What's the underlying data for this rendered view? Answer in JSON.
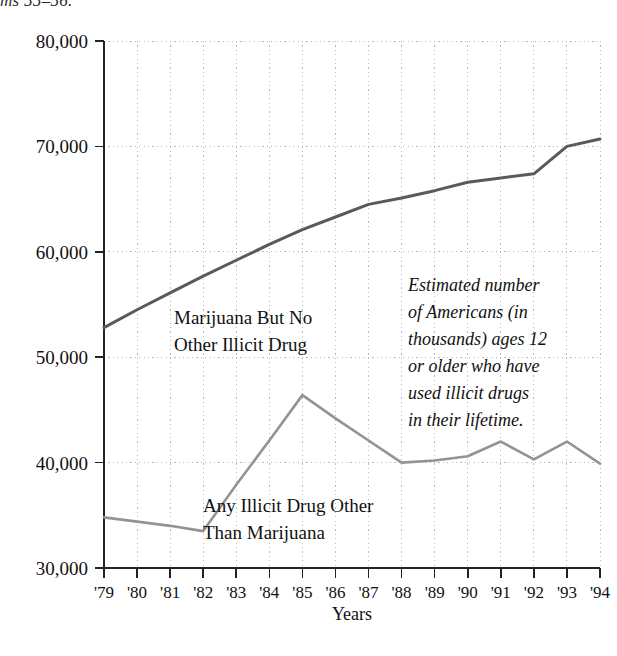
{
  "page": {
    "header_fragment": "ms 55–56."
  },
  "chart_data": {
    "type": "line",
    "title": "",
    "subtitle": "",
    "xlabel": "Years",
    "ylabel": "",
    "grid": true,
    "legend_position": "inline-annotation",
    "categories": [
      "'79",
      "'80",
      "'81",
      "'82",
      "'83",
      "'84",
      "'85",
      "'86",
      "'87",
      "'88",
      "'89",
      "'90",
      "'91",
      "'92",
      "'93",
      "'94"
    ],
    "x": [
      1979,
      1980,
      1981,
      1982,
      1983,
      1984,
      1985,
      1986,
      1987,
      1988,
      1989,
      1990,
      1991,
      1992,
      1993,
      1994
    ],
    "xlim": [
      1979,
      1994
    ],
    "ylim": [
      30000,
      80000
    ],
    "ytick_values": [
      30000,
      40000,
      50000,
      60000,
      70000,
      80000
    ],
    "ytick_labels": [
      "30,000",
      "40,000",
      "50,000",
      "60,000",
      "70,000",
      "80,000"
    ],
    "series": [
      {
        "name": "Marijuana But No Other Illicit Drug",
        "color": "#5a5a5a",
        "values": [
          52800,
          54500,
          56100,
          57700,
          59200,
          60700,
          62100,
          63300,
          64500,
          65100,
          65800,
          66600,
          67000,
          67400,
          70000,
          70700
        ]
      },
      {
        "name": "Any Illicit Drug Other Than Marijuana",
        "color": "#939393",
        "values": [
          34800,
          34400,
          34000,
          33500,
          37900,
          42100,
          46400,
          44200,
          42100,
          40000,
          40200,
          40600,
          42000,
          40300,
          42000,
          39900
        ]
      }
    ],
    "series_labels": [
      {
        "line1": "Marijuana But No",
        "line2": "Other Illicit Drug"
      },
      {
        "line1": "Any Illicit Drug Other",
        "line2": "Than Marijuana"
      }
    ],
    "annotation": {
      "lines": [
        "Estimated number",
        "of Americans (in",
        "thousands) ages 12",
        "or older who have",
        "used illicit drugs",
        "in their lifetime."
      ],
      "full_text": "Estimated number of Americans (in thousands) ages 12 or older who have used illicit drugs in their lifetime."
    },
    "colors": {
      "grid": "#b9b9b9",
      "axis": "#232323",
      "series1": "#5a5a5a",
      "series2": "#939393",
      "background": "#ffffff"
    }
  }
}
